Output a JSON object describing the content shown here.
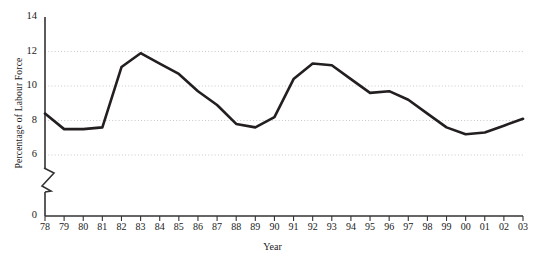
{
  "chart_data": {
    "type": "line",
    "title": "",
    "xlabel": "Year",
    "ylabel": "Percentage of Labour Force",
    "categories": [
      "78",
      "79",
      "80",
      "81",
      "82",
      "83",
      "84",
      "85",
      "86",
      "87",
      "88",
      "89",
      "90",
      "91",
      "92",
      "93",
      "94",
      "95",
      "96",
      "97",
      "98",
      "99",
      "00",
      "01",
      "02",
      "03"
    ],
    "x_full_years": [
      1978,
      1979,
      1980,
      1981,
      1982,
      1983,
      1984,
      1985,
      1986,
      1987,
      1988,
      1989,
      1990,
      1991,
      1992,
      1993,
      1994,
      1995,
      1996,
      1997,
      1998,
      1999,
      2000,
      2001,
      2002,
      2003
    ],
    "values": [
      8.4,
      7.5,
      7.5,
      7.6,
      11.1,
      11.9,
      11.3,
      10.7,
      9.7,
      8.9,
      7.8,
      7.6,
      8.2,
      10.4,
      11.3,
      11.2,
      10.4,
      9.6,
      9.7,
      9.2,
      8.4,
      7.6,
      7.2,
      7.3,
      7.7,
      8.1
    ],
    "series": [
      {
        "name": "Unemployment rate",
        "values": [
          8.4,
          7.5,
          7.5,
          7.6,
          11.1,
          11.9,
          11.3,
          10.7,
          9.7,
          8.9,
          7.8,
          7.6,
          8.2,
          10.4,
          11.3,
          11.2,
          10.4,
          9.6,
          9.7,
          9.2,
          8.4,
          7.6,
          7.2,
          7.3,
          7.7,
          8.1
        ],
        "color": "#231f20",
        "line_width": 2.6
      }
    ],
    "y_tick_labels": [
      "0",
      "6",
      "8",
      "10",
      "12",
      "14"
    ],
    "y_tick_values": [
      0,
      6,
      8,
      10,
      12,
      14
    ],
    "ylim": [
      6,
      14
    ],
    "gridlines": [
      6,
      8,
      10,
      12
    ],
    "grid": "dotted-horizontal",
    "axis_break": true,
    "axis_break_note": "y-axis broken between 0 and 6",
    "legend": "none",
    "line_color": "#231f20",
    "grid_color": "#c9c9c9",
    "axis_color": "#333333",
    "background": "#ffffff"
  }
}
